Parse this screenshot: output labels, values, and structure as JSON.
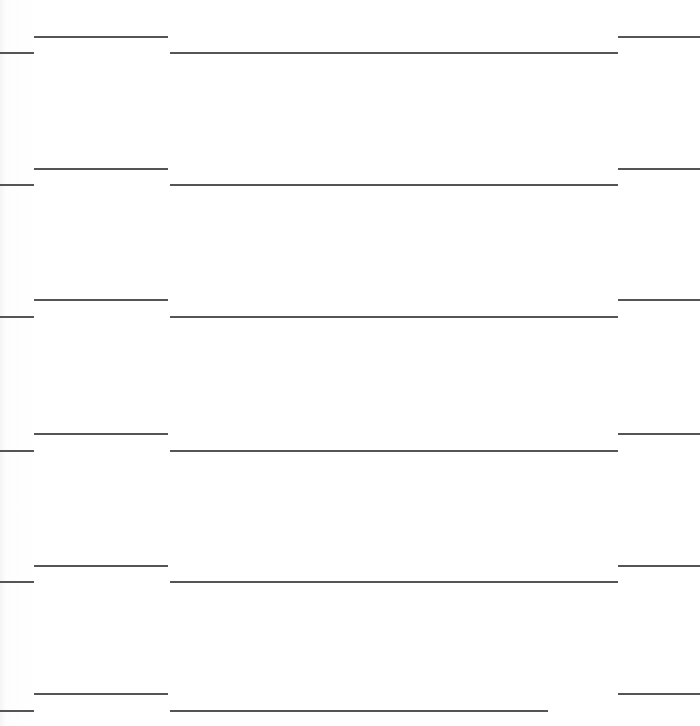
{
  "page": {
    "type": "blank ruled sheet",
    "background_color": "#ffffff",
    "rule_color": "#555555",
    "row_count": 6
  },
  "rows": [
    {
      "upper_y": 36,
      "lower_y": 52,
      "lower_center_end": 618
    },
    {
      "upper_y": 168,
      "lower_y": 184,
      "lower_center_end": 618
    },
    {
      "upper_y": 299,
      "lower_y": 316,
      "lower_center_end": 618
    },
    {
      "upper_y": 433,
      "lower_y": 450,
      "lower_center_end": 618
    },
    {
      "upper_y": 565,
      "lower_y": 581,
      "lower_center_end": 618
    },
    {
      "upper_y": 693,
      "lower_y": 710,
      "lower_center_end": 548
    }
  ],
  "segments": {
    "upper_left": {
      "x1": 34,
      "x2": 168
    },
    "upper_right": {
      "x1": 618,
      "x2": 700
    },
    "lower_left": {
      "x1": 0,
      "x2": 34
    },
    "lower_center": {
      "x1": 170
    }
  }
}
